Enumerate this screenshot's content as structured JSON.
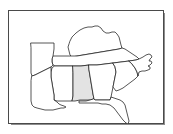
{
  "figure": {
    "type": "outline-map",
    "region": "Southeastern United States",
    "background_color": "#ffffff",
    "frame": {
      "visible": true,
      "border_color": "#4a4a4a",
      "shadow_color": "#8d8d8d"
    }
  },
  "map": {
    "projection_note": "simple planar outline",
    "default_fill": "#ffffff",
    "outline_color": "#1d1d1d",
    "highlight_fill": "#e3e3e3",
    "highlighted_states": [
      "Alabama"
    ],
    "states": [
      {
        "name": "Kentucky",
        "abbr": "KY",
        "highlighted": false,
        "fill": "#ffffff",
        "path": "M 61 30 L 63 26 L 67 22 L 71 19 L 75 17 L 79 16 L 83 16 L 86 15 L 89 15 L 92 17 L 94 20 L 97 22 L 100 22 L 103 21 L 106 21 L 108 23 L 110 26 L 111 30 L 112 34 L 113 37 L 110 38 L 104 39 L 98 40 L 92 41 L 86 42 L 80 43 L 74 44 L 68 45 L 63 46 L 61 44 L 60 40 L 59 36 L 60 33 Z"
      },
      {
        "name": "Tennessee",
        "abbr": "TN",
        "highlighted": false,
        "fill": "#ffffff",
        "path": "M 44 45 L 48 45 L 54 45 L 61 45 L 68 45 L 74 44 L 80 43 L 86 42 L 92 41 L 98 40 L 104 39 L 110 38 L 113 37 L 116 38 L 119 40 L 122 42 L 125 44 L 128 46 L 130 48 L 127 49 L 120 50 L 112 51 L 104 52 L 96 53 L 88 54 L 80 54 L 72 55 L 64 55 L 56 55 L 50 55 L 46 55 L 44 54 L 43 51 L 43 48 Z"
      },
      {
        "name": "Arkansas",
        "abbr": "AR",
        "highlighted": false,
        "fill": "#ffffff",
        "path": "M 22 32 L 30 32 L 38 32 L 45 32 L 45 38 L 44 45 L 43 48 L 43 51 L 44 54 L 42 56 L 38 58 L 34 60 L 30 62 L 26 64 L 23 65 L 22 62 L 22 57 L 22 52 L 22 47 L 22 42 L 22 37 Z"
      },
      {
        "name": "Mississippi",
        "abbr": "MS",
        "highlighted": false,
        "fill": "#ffffff",
        "path": "M 46 55 L 50 55 L 56 55 L 62 55 L 64 55 L 64 62 L 64 70 L 64 78 L 64 85 L 63 90 L 58 90 L 53 90 L 48 90 L 45 89 L 45 84 L 44 78 L 43 72 L 42 66 L 42 61 L 43 57 Z"
      },
      {
        "name": "Louisiana",
        "abbr": "LA",
        "highlighted": false,
        "fill": "#ffffff",
        "path": "M 23 65 L 26 64 L 30 62 L 34 60 L 38 58 L 42 56 L 42 61 L 42 66 L 43 72 L 44 78 L 45 84 L 45 89 L 48 91 L 50 93 L 52 94 L 55 95 L 57 96 L 55 97 L 52 97 L 48 98 L 44 99 L 40 99 L 36 99 L 32 98 L 28 97 L 25 96 L 23 94 L 22 90 L 22 85 L 22 80 L 22 75 L 22 70 Z"
      },
      {
        "name": "Alabama",
        "abbr": "AL",
        "highlighted": true,
        "fill": "#e3e3e3",
        "path": "M 64 55 L 72 55 L 80 54 L 80 59 L 81 65 L 82 71 L 83 77 L 84 83 L 85 88 L 81 89 L 76 89 L 71 89 L 66 90 L 63 90 L 64 85 L 64 78 L 64 70 L 64 62 Z"
      },
      {
        "name": "Georgia",
        "abbr": "GA",
        "highlighted": false,
        "fill": "#ffffff",
        "path": "M 80 54 L 88 54 L 96 53 L 104 52 L 106 56 L 107 61 L 106 66 L 105 71 L 104 76 L 103 81 L 102 86 L 101 89 L 96 89 L 91 89 L 86 89 L 85 88 L 84 83 L 83 77 L 82 71 L 81 65 L 80 59 Z"
      },
      {
        "name": "South Carolina",
        "abbr": "SC",
        "highlighted": false,
        "fill": "#ffffff",
        "path": "M 104 52 L 112 51 L 120 50 L 123 53 L 126 57 L 128 61 L 129 65 L 126 68 L 122 71 L 118 74 L 114 77 L 110 79 L 107 80 L 104 76 L 105 71 L 106 66 L 107 61 L 106 56 Z"
      },
      {
        "name": "North Carolina",
        "abbr": "NC",
        "highlighted": false,
        "fill": "#ffffff",
        "path": "M 120 50 L 127 49 L 130 48 L 134 46 L 137 44 L 140 43 L 142 44 L 143 46 L 141 48 L 140 50 L 142 50 L 143 52 L 141 54 L 139 55 L 141 56 L 141 58 L 139 59 L 136 60 L 133 60 L 130 61 L 129 65 L 128 61 L 126 57 L 123 53 Z"
      },
      {
        "name": "Florida",
        "abbr": "FL",
        "highlighted": false,
        "fill": "#ffffff",
        "path": "M 85 88 L 86 89 L 91 89 L 96 89 L 101 89 L 102 86 L 105 87 L 108 88 L 111 89 L 114 91 L 116 94 L 117 98 L 118 102 L 119 106 L 120 110 L 119 113 L 117 112 L 114 109 L 111 105 L 108 101 L 105 97 L 101 94 L 97 93 L 93 93 L 89 92 L 85 92 L 81 92 L 77 92 L 73 92 L 70 92 L 70 90 L 73 90 L 77 90 L 81 89 Z"
      }
    ]
  }
}
